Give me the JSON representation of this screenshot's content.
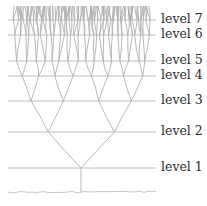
{
  "diagram": {
    "colors": {
      "line": "#bdbdbd",
      "branch": "#b0b0b0",
      "text": "#2a2a2a",
      "ground": "#c8c8c8"
    },
    "trunk_x": 81,
    "ground_y": 192,
    "line_x_start": 8,
    "line_x_end": 156,
    "levels": [
      {
        "label": "level 7",
        "y": 20
      },
      {
        "label": "level 6",
        "y": 35
      },
      {
        "label": "level 5",
        "y": 61
      },
      {
        "label": "level 4",
        "y": 76
      },
      {
        "label": "level 3",
        "y": 101
      },
      {
        "label": "level 2",
        "y": 132
      },
      {
        "label": "level 1",
        "y": 168
      }
    ]
  }
}
